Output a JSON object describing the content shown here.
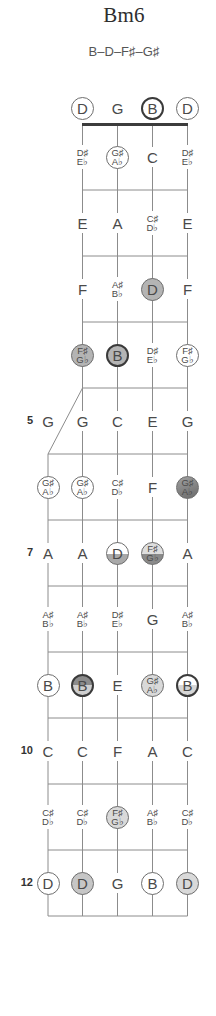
{
  "title": "Bm6",
  "formula": "B–D–F♯–G♯",
  "palette": {
    "line": "#8c8c8c",
    "nut": "#3c3c3c",
    "text": "#4a4a4a",
    "fill": "#b4b4b4",
    "fill_light": "#d9d9d9",
    "fill_dark": "#8a8a8a"
  },
  "strings": [
    "5th",
    "4th",
    "3rd",
    "2nd",
    "1st"
  ],
  "open_row": [
    null,
    {
      "note": [
        "D"
      ],
      "marker": "outline"
    },
    {
      "note": [
        "G"
      ],
      "marker": "none"
    },
    {
      "note": [
        "B"
      ],
      "marker": "outline-bold"
    },
    {
      "note": [
        "D"
      ],
      "marker": "outline"
    }
  ],
  "frets": [
    {
      "number": 1,
      "label": "",
      "cells": [
        null,
        {
          "note": [
            "D♯",
            "E♭"
          ],
          "marker": "none"
        },
        {
          "note": [
            "G♯",
            "A♭"
          ],
          "marker": "outline"
        },
        {
          "note": [
            "C"
          ],
          "marker": "none"
        },
        {
          "note": [
            "D♯",
            "E♭"
          ],
          "marker": "none"
        }
      ]
    },
    {
      "number": 2,
      "label": "",
      "cells": [
        null,
        {
          "note": [
            "E"
          ],
          "marker": "none"
        },
        {
          "note": [
            "A"
          ],
          "marker": "none"
        },
        {
          "note": [
            "C♯",
            "D♭"
          ],
          "marker": "none"
        },
        {
          "note": [
            "E"
          ],
          "marker": "none"
        }
      ]
    },
    {
      "number": 3,
      "label": "",
      "cells": [
        null,
        {
          "note": [
            "F"
          ],
          "marker": "none"
        },
        {
          "note": [
            "A♯",
            "B♭"
          ],
          "marker": "none"
        },
        {
          "note": [
            "D"
          ],
          "marker": "fill"
        },
        {
          "note": [
            "F"
          ],
          "marker": "none"
        }
      ]
    },
    {
      "number": 4,
      "label": "",
      "cells": [
        null,
        {
          "note": [
            "F♯",
            "G♭"
          ],
          "marker": "fill"
        },
        {
          "note": [
            "B"
          ],
          "marker": "fill-bold"
        },
        {
          "note": [
            "D♯",
            "E♭"
          ],
          "marker": "none"
        },
        {
          "note": [
            "F♯",
            "G♭"
          ],
          "marker": "outline"
        }
      ]
    },
    {
      "number": 5,
      "label": "5",
      "cells": [
        {
          "note": [
            "G"
          ],
          "marker": "none"
        },
        {
          "note": [
            "G"
          ],
          "marker": "none"
        },
        {
          "note": [
            "C"
          ],
          "marker": "none"
        },
        {
          "note": [
            "E"
          ],
          "marker": "none"
        },
        {
          "note": [
            "G"
          ],
          "marker": "none"
        }
      ]
    },
    {
      "number": 6,
      "label": "",
      "cells": [
        {
          "note": [
            "G♯",
            "A♭"
          ],
          "marker": "outline"
        },
        {
          "note": [
            "G♯",
            "A♭"
          ],
          "marker": "outline"
        },
        {
          "note": [
            "C♯",
            "D♭"
          ],
          "marker": "none"
        },
        {
          "note": [
            "F"
          ],
          "marker": "none"
        },
        {
          "note": [
            "G♯",
            "A♭"
          ],
          "marker": "fill-dark"
        }
      ]
    },
    {
      "number": 7,
      "label": "7",
      "cells": [
        {
          "note": [
            "A"
          ],
          "marker": "none"
        },
        {
          "note": [
            "A"
          ],
          "marker": "none"
        },
        {
          "note": [
            "D"
          ],
          "marker": "half-low"
        },
        {
          "note": [
            "F♯",
            "G♭"
          ],
          "marker": "half-dark"
        },
        {
          "note": [
            "A"
          ],
          "marker": "none"
        }
      ]
    },
    {
      "number": 8,
      "label": "",
      "cells": [
        {
          "note": [
            "A♯",
            "B♭"
          ],
          "marker": "none"
        },
        {
          "note": [
            "A♯",
            "B♭"
          ],
          "marker": "none"
        },
        {
          "note": [
            "D♯",
            "E♭"
          ],
          "marker": "none"
        },
        {
          "note": [
            "G"
          ],
          "marker": "none"
        },
        {
          "note": [
            "A♯",
            "B♭"
          ],
          "marker": "none"
        }
      ]
    },
    {
      "number": 9,
      "label": "",
      "cells": [
        {
          "note": [
            "B"
          ],
          "marker": "outline"
        },
        {
          "note": [
            "B"
          ],
          "marker": "split-bold-dark"
        },
        {
          "note": [
            "E"
          ],
          "marker": "none"
        },
        {
          "note": [
            "G♯",
            "A♭"
          ],
          "marker": "fill-light"
        },
        {
          "note": [
            "B"
          ],
          "marker": "split-bold-light"
        }
      ]
    },
    {
      "number": 10,
      "label": "10",
      "cells": [
        {
          "note": [
            "C"
          ],
          "marker": "none"
        },
        {
          "note": [
            "C"
          ],
          "marker": "none"
        },
        {
          "note": [
            "F"
          ],
          "marker": "none"
        },
        {
          "note": [
            "A"
          ],
          "marker": "none"
        },
        {
          "note": [
            "C"
          ],
          "marker": "none"
        }
      ]
    },
    {
      "number": 11,
      "label": "",
      "cells": [
        {
          "note": [
            "C♯",
            "D♭"
          ],
          "marker": "none"
        },
        {
          "note": [
            "C♯",
            "D♭"
          ],
          "marker": "none"
        },
        {
          "note": [
            "F♯",
            "G♭"
          ],
          "marker": "fill-light"
        },
        {
          "note": [
            "A♯",
            "B♭"
          ],
          "marker": "none"
        },
        {
          "note": [
            "C♯",
            "D♭"
          ],
          "marker": "none"
        }
      ]
    },
    {
      "number": 12,
      "label": "12",
      "cells": [
        {
          "note": [
            "D"
          ],
          "marker": "outline"
        },
        {
          "note": [
            "D"
          ],
          "marker": "fill-mid"
        },
        {
          "note": [
            "G"
          ],
          "marker": "none"
        },
        {
          "note": [
            "B"
          ],
          "marker": "outline"
        },
        {
          "note": [
            "D"
          ],
          "marker": "fill-light"
        }
      ]
    }
  ]
}
